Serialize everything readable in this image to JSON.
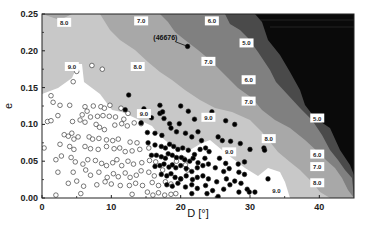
{
  "chart_data": {
    "type": "heatmap",
    "subtype": "contour-with-scatter",
    "title": "",
    "xlabel": "D [°]",
    "ylabel": "e",
    "xlim": [
      0,
      45
    ],
    "ylim": [
      0.0,
      0.25
    ],
    "x_ticks": [
      "0",
      "10",
      "20",
      "30",
      "40"
    ],
    "y_ticks": [
      "0.00",
      "0.05",
      "0.10",
      "0.15",
      "0.20",
      "0.25"
    ],
    "grid": false,
    "legend": null,
    "contour_levels": [
      5.0,
      6.0,
      7.0,
      8.0,
      9.0
    ],
    "contour_colors": {
      "gt9": "#ffffff",
      "8_9": "#c8c8c8",
      "7_8": "#a8a8a8",
      "6_7": "#808080",
      "5_6": "#4a4a4a",
      "lt5": "#0a0a0a"
    },
    "contour_labels": [
      {
        "text": "8.0",
        "x": 3.2,
        "y": 0.238
      },
      {
        "text": "7.0",
        "x": 14.3,
        "y": 0.24
      },
      {
        "text": "6.0",
        "x": 24.5,
        "y": 0.24
      },
      {
        "text": "9.0",
        "x": 4.3,
        "y": 0.178
      },
      {
        "text": "8.0",
        "x": 13.8,
        "y": 0.178
      },
      {
        "text": "5.0",
        "x": 29.5,
        "y": 0.21
      },
      {
        "text": "7.0",
        "x": 24.0,
        "y": 0.185
      },
      {
        "text": "6.0",
        "x": 29.8,
        "y": 0.16
      },
      {
        "text": "7.0",
        "x": 29.8,
        "y": 0.131
      },
      {
        "text": "9.0",
        "x": 14.7,
        "y": 0.114
      },
      {
        "text": "9.0",
        "x": 24.0,
        "y": 0.109
      },
      {
        "text": "5.0",
        "x": 39.7,
        "y": 0.108
      },
      {
        "text": "8.0",
        "x": 32.7,
        "y": 0.08
      },
      {
        "text": "6.0",
        "x": 39.7,
        "y": 0.059
      },
      {
        "text": "7.0",
        "x": 39.7,
        "y": 0.042
      },
      {
        "text": "9.0",
        "x": 27.0,
        "y": 0.062
      },
      {
        "text": "8.0",
        "x": 39.7,
        "y": 0.02
      },
      {
        "text": "9.0",
        "x": 33.8,
        "y": 0.01
      }
    ],
    "annotations": [
      {
        "text": "(46676)",
        "x": 17.8,
        "y": 0.215,
        "arrow_to": {
          "x": 21.0,
          "y": 0.206
        }
      }
    ],
    "series": [
      {
        "name": "open-circles",
        "marker": "open-circle",
        "points": [
          [
            5.0,
            0.172
          ],
          [
            7.2,
            0.18
          ],
          [
            8.7,
            0.175
          ],
          [
            4.5,
            0.158
          ],
          [
            1.3,
            0.139
          ],
          [
            1.6,
            0.13
          ],
          [
            2.6,
            0.126
          ],
          [
            4.0,
            0.126
          ],
          [
            6.2,
            0.124
          ],
          [
            6.5,
            0.118
          ],
          [
            7.4,
            0.125
          ],
          [
            8.5,
            0.124
          ],
          [
            9.0,
            0.122
          ],
          [
            9.8,
            0.126
          ],
          [
            11.4,
            0.122
          ],
          [
            12.4,
            0.115
          ],
          [
            5.8,
            0.113
          ],
          [
            7.0,
            0.11
          ],
          [
            8.0,
            0.111
          ],
          [
            8.8,
            0.112
          ],
          [
            9.7,
            0.111
          ],
          [
            10.6,
            0.11
          ],
          [
            11.8,
            0.107
          ],
          [
            13.3,
            0.102
          ],
          [
            0.8,
            0.104
          ],
          [
            1.3,
            0.105
          ],
          [
            2.3,
            0.112
          ],
          [
            4.4,
            0.104
          ],
          [
            5.5,
            0.106
          ],
          [
            6.2,
            0.103
          ],
          [
            7.8,
            0.1
          ],
          [
            8.3,
            0.096
          ],
          [
            9.0,
            0.093
          ],
          [
            10.5,
            0.099
          ],
          [
            11.5,
            0.101
          ],
          [
            12.3,
            0.098
          ],
          [
            14.3,
            0.101
          ],
          [
            3.2,
            0.086
          ],
          [
            3.8,
            0.084
          ],
          [
            4.3,
            0.088
          ],
          [
            4.6,
            0.08
          ],
          [
            5.2,
            0.083
          ],
          [
            6.8,
            0.083
          ],
          [
            7.3,
            0.08
          ],
          [
            8.2,
            0.081
          ],
          [
            9.3,
            0.079
          ],
          [
            10.2,
            0.078
          ],
          [
            11.0,
            0.08
          ],
          [
            12.7,
            0.076
          ],
          [
            13.7,
            0.075
          ],
          [
            0.3,
            0.068
          ],
          [
            2.6,
            0.073
          ],
          [
            4.0,
            0.07
          ],
          [
            4.6,
            0.066
          ],
          [
            6.2,
            0.07
          ],
          [
            7.0,
            0.067
          ],
          [
            8.1,
            0.066
          ],
          [
            9.3,
            0.07
          ],
          [
            10.4,
            0.067
          ],
          [
            11.2,
            0.068
          ],
          [
            12.0,
            0.063
          ],
          [
            13.0,
            0.064
          ],
          [
            14.1,
            0.066
          ],
          [
            15.4,
            0.068
          ],
          [
            2.0,
            0.052
          ],
          [
            2.8,
            0.057
          ],
          [
            4.2,
            0.055
          ],
          [
            4.8,
            0.049
          ],
          [
            5.9,
            0.046
          ],
          [
            6.6,
            0.052
          ],
          [
            7.7,
            0.051
          ],
          [
            8.6,
            0.047
          ],
          [
            9.3,
            0.044
          ],
          [
            10.2,
            0.048
          ],
          [
            10.8,
            0.052
          ],
          [
            11.5,
            0.044
          ],
          [
            12.4,
            0.05
          ],
          [
            13.2,
            0.046
          ],
          [
            14.4,
            0.048
          ],
          [
            15.5,
            0.051
          ],
          [
            16.4,
            0.049
          ],
          [
            2.3,
            0.035
          ],
          [
            4.5,
            0.035
          ],
          [
            6.3,
            0.038
          ],
          [
            7.0,
            0.031
          ],
          [
            8.2,
            0.035
          ],
          [
            9.4,
            0.028
          ],
          [
            10.3,
            0.033
          ],
          [
            11.0,
            0.029
          ],
          [
            12.0,
            0.034
          ],
          [
            12.7,
            0.028
          ],
          [
            13.6,
            0.031
          ],
          [
            14.3,
            0.037
          ],
          [
            15.4,
            0.035
          ],
          [
            16.2,
            0.03
          ],
          [
            17.4,
            0.038
          ],
          [
            3.8,
            0.02
          ],
          [
            5.0,
            0.023
          ],
          [
            6.0,
            0.016
          ],
          [
            7.9,
            0.018
          ],
          [
            9.1,
            0.022
          ],
          [
            10.0,
            0.019
          ],
          [
            11.3,
            0.017
          ],
          [
            12.6,
            0.017
          ],
          [
            13.5,
            0.02
          ],
          [
            14.5,
            0.017
          ],
          [
            15.9,
            0.021
          ],
          [
            16.8,
            0.017
          ],
          [
            17.8,
            0.022
          ],
          [
            18.6,
            0.019
          ],
          [
            2.0,
            0.004
          ],
          [
            5.6,
            0.006
          ],
          [
            13.0,
            0.005
          ],
          [
            15.2,
            0.008
          ],
          [
            16.0,
            0.004
          ],
          [
            16.8,
            0.007
          ],
          [
            17.7,
            0.004
          ],
          [
            18.6,
            0.005
          ],
          [
            19.3,
            0.006
          ],
          [
            20.7,
            0.045
          ],
          [
            21.0,
            0.038
          ],
          [
            20.0,
            0.026
          ],
          [
            20.5,
            0.053
          ],
          [
            19.4,
            0.05
          ]
        ]
      },
      {
        "name": "filled-circles",
        "marker": "filled-circle",
        "points": [
          [
            21.0,
            0.206
          ],
          [
            12.5,
            0.14
          ],
          [
            17.0,
            0.126
          ],
          [
            12.0,
            0.12
          ],
          [
            14.7,
            0.121
          ],
          [
            17.0,
            0.115
          ],
          [
            17.4,
            0.117
          ],
          [
            20.0,
            0.125
          ],
          [
            21.1,
            0.118
          ],
          [
            14.3,
            0.102
          ],
          [
            15.8,
            0.109
          ],
          [
            17.6,
            0.108
          ],
          [
            18.4,
            0.101
          ],
          [
            19.8,
            0.101
          ],
          [
            22.0,
            0.107
          ],
          [
            24.5,
            0.117
          ],
          [
            27.8,
            0.1
          ],
          [
            26.5,
            0.105
          ],
          [
            15.2,
            0.089
          ],
          [
            16.3,
            0.088
          ],
          [
            17.3,
            0.085
          ],
          [
            18.6,
            0.095
          ],
          [
            19.4,
            0.09
          ],
          [
            20.7,
            0.088
          ],
          [
            21.6,
            0.083
          ],
          [
            22.5,
            0.09
          ],
          [
            23.0,
            0.078
          ],
          [
            25.4,
            0.083
          ],
          [
            26.0,
            0.078
          ],
          [
            27.2,
            0.077
          ],
          [
            28.6,
            0.074
          ],
          [
            30.0,
            0.066
          ],
          [
            32.0,
            0.068
          ],
          [
            32.1,
            0.065
          ],
          [
            15.3,
            0.075
          ],
          [
            16.3,
            0.072
          ],
          [
            17.2,
            0.07
          ],
          [
            17.8,
            0.068
          ],
          [
            18.4,
            0.073
          ],
          [
            19.0,
            0.07
          ],
          [
            19.6,
            0.066
          ],
          [
            20.3,
            0.068
          ],
          [
            21.1,
            0.065
          ],
          [
            22.0,
            0.059
          ],
          [
            22.8,
            0.066
          ],
          [
            23.6,
            0.068
          ],
          [
            24.1,
            0.063
          ],
          [
            15.8,
            0.058
          ],
          [
            16.5,
            0.058
          ],
          [
            17.2,
            0.056
          ],
          [
            17.8,
            0.054
          ],
          [
            18.2,
            0.06
          ],
          [
            18.8,
            0.058
          ],
          [
            19.4,
            0.055
          ],
          [
            20.1,
            0.055
          ],
          [
            20.6,
            0.052
          ],
          [
            21.3,
            0.05
          ],
          [
            21.8,
            0.054
          ],
          [
            22.5,
            0.048
          ],
          [
            23.5,
            0.054
          ],
          [
            25.6,
            0.054
          ],
          [
            26.5,
            0.047
          ],
          [
            28.3,
            0.046
          ],
          [
            29.2,
            0.049
          ],
          [
            16.3,
            0.043
          ],
          [
            17.0,
            0.044
          ],
          [
            17.6,
            0.046
          ],
          [
            18.3,
            0.042
          ],
          [
            18.8,
            0.045
          ],
          [
            19.3,
            0.041
          ],
          [
            20.0,
            0.044
          ],
          [
            20.8,
            0.04
          ],
          [
            21.6,
            0.036
          ],
          [
            22.4,
            0.041
          ],
          [
            23.2,
            0.044
          ],
          [
            24.0,
            0.046
          ],
          [
            25.0,
            0.041
          ],
          [
            26.2,
            0.036
          ],
          [
            27.0,
            0.04
          ],
          [
            28.4,
            0.035
          ],
          [
            29.2,
            0.032
          ],
          [
            32.6,
            0.026
          ],
          [
            17.2,
            0.032
          ],
          [
            18.0,
            0.03
          ],
          [
            18.6,
            0.033
          ],
          [
            19.2,
            0.028
          ],
          [
            20.0,
            0.026
          ],
          [
            20.8,
            0.03
          ],
          [
            21.7,
            0.025
          ],
          [
            22.4,
            0.028
          ],
          [
            23.2,
            0.03
          ],
          [
            24.0,
            0.026
          ],
          [
            25.2,
            0.022
          ],
          [
            26.6,
            0.026
          ],
          [
            27.8,
            0.023
          ],
          [
            28.7,
            0.02
          ],
          [
            29.6,
            0.012
          ],
          [
            18.0,
            0.018
          ],
          [
            18.8,
            0.016
          ],
          [
            19.6,
            0.02
          ],
          [
            20.7,
            0.015
          ],
          [
            21.6,
            0.018
          ],
          [
            22.4,
            0.013
          ],
          [
            23.6,
            0.017
          ],
          [
            24.6,
            0.01
          ],
          [
            26.2,
            0.012
          ],
          [
            27.1,
            0.018
          ],
          [
            28.4,
            0.008
          ],
          [
            29.9,
            0.008
          ],
          [
            30.7,
            0.008
          ],
          [
            21.6,
            0.006
          ],
          [
            23.8,
            0.006
          ],
          [
            25.4,
            0.002
          ]
        ]
      }
    ]
  }
}
